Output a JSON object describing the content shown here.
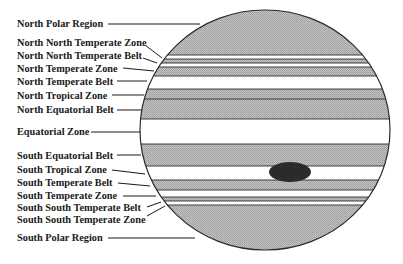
{
  "diagram": {
    "planet": {
      "cx": 265,
      "cy": 130,
      "rx": 125,
      "ry": 120,
      "outline_color": "#2a2a2a",
      "shade_color": "#b4b4b4",
      "zone_color": "#ffffff"
    },
    "spot": {
      "name": "Great Red Spot",
      "cx": 290,
      "cy": 172,
      "rx": 21,
      "ry": 10,
      "color": "#2b2b2b"
    },
    "bands": [
      {
        "name": "North Polar Region",
        "type": "shaded",
        "y0": 10,
        "y1": 55
      },
      {
        "name": "North North Temperate Zone",
        "type": "zone",
        "y0": 55,
        "y1": 59
      },
      {
        "name": "North North Temperate Belt",
        "type": "shaded",
        "y0": 59,
        "y1": 63
      },
      {
        "name": "North Temperate Zone",
        "type": "zone",
        "y0": 63,
        "y1": 67
      },
      {
        "name": "North Temperate Belt",
        "type": "shaded",
        "y0": 67,
        "y1": 76
      },
      {
        "name": "North Tropical Zone",
        "type": "zone",
        "y0": 76,
        "y1": 89
      },
      {
        "name": "North Equatorial Belt",
        "type": "shaded",
        "y0": 89,
        "y1": 99
      },
      {
        "name": "Equatorial Zone (north)",
        "type": "zone",
        "y0": 99,
        "y1": 99
      },
      {
        "name": "North Equatorial Belt (lower)",
        "type": "shaded",
        "y0": 99,
        "y1": 119
      },
      {
        "name": "Equatorial Zone",
        "type": "zone",
        "y0": 119,
        "y1": 144
      },
      {
        "name": "South Equatorial Belt",
        "type": "shaded",
        "y0": 144,
        "y1": 166
      },
      {
        "name": "South Tropical Zone",
        "type": "zone",
        "y0": 166,
        "y1": 180
      },
      {
        "name": "South Temperate Belt",
        "type": "shaded",
        "y0": 180,
        "y1": 190
      },
      {
        "name": "South Temperate Zone",
        "type": "zone",
        "y0": 190,
        "y1": 197
      },
      {
        "name": "South South Temperate Belt",
        "type": "shaded",
        "y0": 197,
        "y1": 201
      },
      {
        "name": "South South Temperate Zone",
        "type": "zone",
        "y0": 201,
        "y1": 205
      },
      {
        "name": "South Polar Region",
        "type": "shaded",
        "y0": 205,
        "y1": 250
      }
    ],
    "labels": [
      {
        "text": "North Polar Region",
        "x": 17,
        "y": 27,
        "line": [
          108,
          24,
          200,
          24
        ]
      },
      {
        "text": "North North Temperate Zone",
        "x": 17,
        "y": 46,
        "line": [
          145,
          45,
          162,
          58
        ]
      },
      {
        "text": "North North Temperate Belt",
        "x": 17,
        "y": 59,
        "line": [
          143,
          58,
          157,
          63
        ]
      },
      {
        "text": "North Temperate Zone",
        "x": 17,
        "y": 72,
        "line": [
          123,
          68,
          154,
          71
        ]
      },
      {
        "text": "North Temperate Belt",
        "x": 17,
        "y": 85,
        "line": [
          117,
          81,
          147,
          81
        ]
      },
      {
        "text": "North Tropical Zone",
        "x": 17,
        "y": 99,
        "line": [
          112,
          95,
          144,
          95
        ]
      },
      {
        "text": "North Equatorial Belt",
        "x": 17,
        "y": 113,
        "line": [
          117,
          110,
          142,
          110
        ]
      },
      {
        "text": "Equatorial Zone",
        "x": 17,
        "y": 135,
        "line": [
          91,
          132,
          140,
          132
        ]
      },
      {
        "text": "South Equatorial Belt",
        "x": 17,
        "y": 159,
        "line": [
          117,
          155,
          141,
          155
        ]
      },
      {
        "text": "South Tropical Zone",
        "x": 17,
        "y": 173,
        "line": [
          112,
          170,
          145,
          174
        ]
      },
      {
        "text": "South Temperate Belt",
        "x": 17,
        "y": 186,
        "line": [
          118,
          183,
          150,
          186
        ]
      },
      {
        "text": "South Temperate Zone",
        "x": 17,
        "y": 199,
        "line": [
          123,
          196,
          156,
          196
        ]
      },
      {
        "text": "South South Temperate Belt",
        "x": 17,
        "y": 211,
        "line": [
          147,
          207,
          161,
          202
        ]
      },
      {
        "text": "South South Temperate Zone",
        "x": 17,
        "y": 223,
        "line": [
          147,
          216,
          165,
          206
        ]
      },
      {
        "text": "South Polar Region",
        "x": 17,
        "y": 241,
        "line": [
          108,
          238,
          195,
          238
        ]
      }
    ]
  }
}
